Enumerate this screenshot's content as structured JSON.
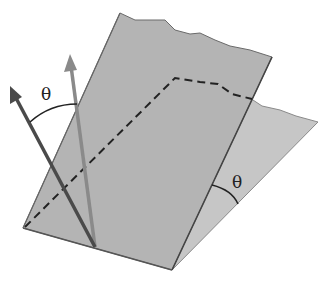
{
  "diagram": {
    "labels": {
      "theta_top": "θ",
      "theta_right": "θ"
    },
    "colors": {
      "plane_front": "#b4b4b4",
      "plane_back": "#c6c6c6",
      "edge": "#555555",
      "arrow_dark": "#4a4a4a",
      "arrow_light": "#8a8a8a",
      "dashed_line": "#222222"
    }
  }
}
